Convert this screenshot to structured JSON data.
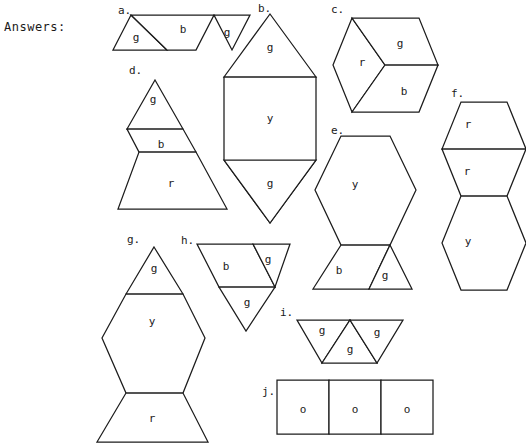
{
  "page": {
    "heading": "Answers:",
    "width": 526,
    "height": 448,
    "background": "#ffffff",
    "ink": "#1c1c1c"
  },
  "legend_keys": {
    "g": "green-triangle",
    "b": "blue-rhombus",
    "r": "red-trapezoid",
    "y": "yellow-hexagon",
    "o": "orange-square"
  },
  "items": [
    {
      "id": "a",
      "tag": "a.",
      "tag_pos": [
        118,
        11
      ],
      "outline": "113,50 131,15 250,15 232,50",
      "pieces": [
        {
          "name": "piece-g-left",
          "path": "113,50 131,15 167,50",
          "label": "g",
          "label_pos": [
            136,
            38
          ]
        },
        {
          "name": "piece-b-mid",
          "path": "131,15 214,15 196,50 167,50",
          "label": "b",
          "label_pos": [
            183,
            30
          ]
        },
        {
          "name": "piece-g-right",
          "path": "214,15 250,15 232,50",
          "label": "g",
          "label_pos": [
            227,
            33
          ]
        }
      ]
    },
    {
      "id": "b",
      "tag": "b.",
      "tag_pos": [
        258,
        9
      ],
      "outline": "270,14 316,77 316,160 270,223 224,160 224,77",
      "pieces": [
        {
          "name": "piece-g-top",
          "path": "270,14 316,77 224,77",
          "label": "g",
          "label_pos": [
            270,
            48
          ]
        },
        {
          "name": "piece-y-middle",
          "path": "316,77 316,160 270,223 224,160 224,77",
          "label": "y",
          "label_pos": [
            270,
            119
          ]
        },
        {
          "name": "piece-g-bottom",
          "path": "224,160 316,160 270,223",
          "label": "g",
          "label_pos": [
            270,
            184
          ]
        }
      ]
    },
    {
      "id": "c",
      "tag": "c.",
      "tag_pos": [
        331,
        10
      ],
      "outline": "352,18 419,18 438,65 419,112 352,112 333,65",
      "pieces": [
        {
          "name": "piece-r-left",
          "path": "352,18 385,65 352,112 333,65",
          "label": "r",
          "label_pos": [
            362,
            63
          ]
        },
        {
          "name": "piece-g-upper",
          "path": "352,18 419,18 438,65 385,65",
          "label": "g",
          "label_pos": [
            400,
            44
          ]
        },
        {
          "name": "piece-b-lower",
          "path": "385,65 438,65 419,112 352,112",
          "label": "b",
          "label_pos": [
            404,
            92
          ]
        }
      ]
    },
    {
      "id": "d",
      "tag": "d.",
      "tag_pos": [
        129,
        71
      ],
      "outline": "155,80 196,152 184,209 118,209 131,152 131,152 119,123 155,80",
      "pieces": [
        {
          "name": "piece-g-top",
          "path": "155,80 183,129 127,129",
          "label": "g",
          "label_pos": [
            153,
            100
          ]
        },
        {
          "name": "piece-b-middle",
          "path": "127,129 183,129 196,152 139,152",
          "label": "b",
          "label_pos": [
            161,
            145
          ]
        },
        {
          "name": "piece-r-bottom",
          "path": "139,152 196,152 227,209 118,209",
          "label": "r",
          "label_pos": [
            171,
            184
          ]
        }
      ]
    },
    {
      "id": "e",
      "tag": "e.",
      "tag_pos": [
        331,
        131
      ],
      "outline": "",
      "pieces": [
        {
          "name": "piece-y-hexagon",
          "path": "341,136 390,136 416,190 390,245 341,245 315,190",
          "label": "y",
          "label_pos": [
            355,
            185
          ]
        },
        {
          "name": "piece-b-lower",
          "path": "341,245 390,245 369,289 313,289",
          "label": "b",
          "label_pos": [
            339,
            271
          ]
        },
        {
          "name": "piece-g-lower",
          "path": "390,245 412,289 369,289",
          "label": "g",
          "label_pos": [
            385,
            276
          ]
        }
      ]
    },
    {
      "id": "f",
      "tag": "f.",
      "tag_pos": [
        451,
        94
      ],
      "outline": "",
      "pieces": [
        {
          "name": "piece-r-upper",
          "path": "461,102 507,102 526,149 442,149",
          "label": "r",
          "label_pos": [
            468,
            125
          ]
        },
        {
          "name": "piece-r-lower",
          "path": "442,149 526,149 507,196 461,196",
          "label": "r",
          "label_pos": [
            467,
            172
          ]
        },
        {
          "name": "piece-y-hexagon",
          "path": "461,196 507,196 526,243 507,290 461,290 442,243",
          "label": "y",
          "label_pos": [
            468,
            242
          ]
        }
      ]
    },
    {
      "id": "g",
      "tag": "g.",
      "tag_pos": [
        127,
        240
      ],
      "outline": "",
      "pieces": [
        {
          "name": "piece-g-top",
          "path": "154,247 183,294 126,294",
          "label": "g",
          "label_pos": [
            154,
            269
          ]
        },
        {
          "name": "piece-y-hexagon",
          "path": "126,294 183,294 205,338 183,393 126,393 102,338",
          "label": "y",
          "label_pos": [
            152,
            322
          ]
        },
        {
          "name": "piece-r-bottom",
          "path": "126,393 183,393 208,442 97,442",
          "label": "r",
          "label_pos": [
            152,
            419
          ]
        }
      ]
    },
    {
      "id": "h",
      "tag": "h.",
      "tag_pos": [
        181,
        241
      ],
      "outline": "",
      "pieces": [
        {
          "name": "piece-b-left",
          "path": "197,244 253,244 275,287 219,287",
          "label": "b",
          "label_pos": [
            226,
            267
          ]
        },
        {
          "name": "piece-g-right",
          "path": "253,244 290,244 275,287",
          "label": "g",
          "label_pos": [
            268,
            260
          ]
        },
        {
          "name": "piece-g-bottom",
          "path": "219,287 275,287 246,331",
          "label": "g",
          "label_pos": [
            247,
            303
          ]
        }
      ]
    },
    {
      "id": "i",
      "tag": "i.",
      "tag_pos": [
        280,
        313
      ],
      "outline": "",
      "pieces": [
        {
          "name": "piece-g-left",
          "path": "297,320 350,320 322,363",
          "label": "g",
          "label_pos": [
            322,
            331
          ]
        },
        {
          "name": "piece-g-middle",
          "path": "350,320 377,363 322,363",
          "label": "g",
          "label_pos": [
            350,
            350
          ]
        },
        {
          "name": "piece-g-right",
          "path": "350,320 403,320 377,363",
          "label": "g",
          "label_pos": [
            377,
            333
          ]
        }
      ]
    },
    {
      "id": "j",
      "tag": "j.",
      "tag_pos": [
        262,
        392
      ],
      "outline": "",
      "pieces": [
        {
          "name": "piece-o-1",
          "path": "277,380 329,380 329,434 277,434",
          "label": "o",
          "label_pos": [
            303,
            410
          ]
        },
        {
          "name": "piece-o-2",
          "path": "329,380 381,380 381,434 329,434",
          "label": "o",
          "label_pos": [
            355,
            410
          ]
        },
        {
          "name": "piece-o-3",
          "path": "381,380 433,380 433,434 381,434",
          "label": "o",
          "label_pos": [
            407,
            410
          ]
        }
      ]
    }
  ]
}
